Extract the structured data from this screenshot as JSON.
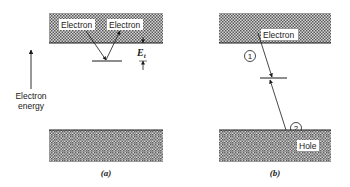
{
  "axis": {
    "label_line1": "Electron",
    "label_line2": "energy"
  },
  "panel_a": {
    "caption": "(a)",
    "conduction_label_1": "Electron",
    "conduction_label_2": "Electron",
    "trap_energy_symbol": "E",
    "trap_energy_subscript": "t"
  },
  "panel_b": {
    "caption": "(b)",
    "conduction_label": "Electron",
    "valence_label": "Hole",
    "step_1": "1",
    "step_2": "2"
  },
  "colors": {
    "band_fill": "#9a9a9a",
    "line": "#1a1a1a",
    "label_bg": "#ffffff"
  }
}
